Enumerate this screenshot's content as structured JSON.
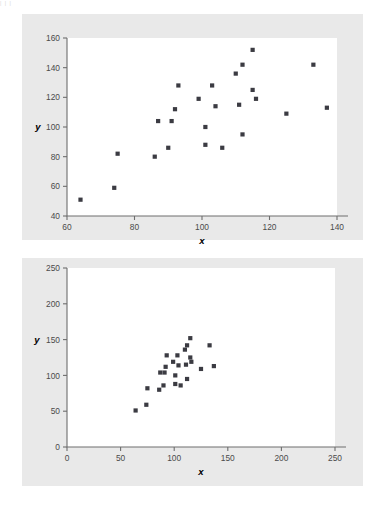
{
  "figure": {
    "background_color": "#ffffff",
    "panel_color": "#e9e9e9",
    "plot_color": "#ffffff",
    "marker_color": "#3b3b42",
    "axis_color": "#6e6e6e"
  },
  "chart_data": [
    {
      "id": "top",
      "type": "scatter",
      "title": "",
      "xlabel": "x",
      "ylabel": "y",
      "xlim": [
        60,
        140
      ],
      "ylim": [
        40,
        160
      ],
      "xticks": [
        60,
        80,
        100,
        120,
        140
      ],
      "yticks": [
        40,
        60,
        80,
        100,
        120,
        140,
        160
      ],
      "xtick_labels": [
        "60",
        "80",
        "100",
        "120",
        "140"
      ],
      "ytick_labels": [
        "40",
        "60",
        "80",
        "100",
        "120",
        "140",
        "160"
      ],
      "grid": false,
      "legend": false,
      "marker": "square",
      "marker_size": 2.1,
      "points": [
        [
          64,
          51
        ],
        [
          74,
          59
        ],
        [
          75,
          82
        ],
        [
          86,
          80
        ],
        [
          87,
          104
        ],
        [
          90,
          86
        ],
        [
          91,
          104
        ],
        [
          92,
          112
        ],
        [
          93,
          128
        ],
        [
          99,
          119
        ],
        [
          101,
          100
        ],
        [
          101,
          88
        ],
        [
          103,
          128
        ],
        [
          104,
          114
        ],
        [
          106,
          86
        ],
        [
          110,
          136
        ],
        [
          111,
          115
        ],
        [
          112,
          142
        ],
        [
          112,
          95
        ],
        [
          115,
          152
        ],
        [
          115,
          125
        ],
        [
          116,
          119
        ],
        [
          125,
          109
        ],
        [
          133,
          142
        ],
        [
          137,
          113
        ]
      ]
    },
    {
      "id": "bottom",
      "type": "scatter",
      "title": "",
      "xlabel": "x",
      "ylabel": "y",
      "xlim": [
        0,
        250
      ],
      "ylim": [
        0,
        250
      ],
      "xticks": [
        0,
        50,
        100,
        150,
        200,
        250
      ],
      "yticks": [
        0,
        50,
        100,
        150,
        200,
        250
      ],
      "xtick_labels": [
        "0",
        "50",
        "100",
        "150",
        "200",
        "250"
      ],
      "ytick_labels": [
        "0",
        "50",
        "100",
        "150",
        "200",
        "250"
      ],
      "grid": false,
      "legend": false,
      "marker": "square",
      "marker_size": 2.1,
      "points": [
        [
          64,
          51
        ],
        [
          74,
          59
        ],
        [
          75,
          82
        ],
        [
          86,
          80
        ],
        [
          87,
          104
        ],
        [
          90,
          86
        ],
        [
          91,
          104
        ],
        [
          92,
          112
        ],
        [
          93,
          128
        ],
        [
          99,
          119
        ],
        [
          101,
          100
        ],
        [
          101,
          88
        ],
        [
          103,
          128
        ],
        [
          104,
          114
        ],
        [
          106,
          86
        ],
        [
          110,
          136
        ],
        [
          111,
          115
        ],
        [
          112,
          142
        ],
        [
          112,
          95
        ],
        [
          115,
          152
        ],
        [
          115,
          125
        ],
        [
          116,
          119
        ],
        [
          125,
          109
        ],
        [
          133,
          142
        ],
        [
          137,
          113
        ]
      ]
    }
  ]
}
